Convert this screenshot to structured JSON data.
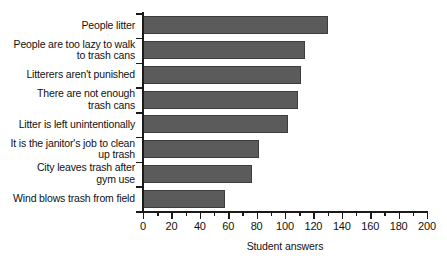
{
  "chart_data": {
    "type": "bar",
    "orientation": "horizontal",
    "title": "",
    "xlabel": "Student answers",
    "ylabel": "",
    "xlim": [
      0,
      200
    ],
    "xticks": [
      0,
      20,
      40,
      60,
      80,
      100,
      120,
      140,
      160,
      180,
      200
    ],
    "xtick_labels": [
      "0",
      "20",
      "40",
      "60",
      "80",
      "100",
      "120",
      "140",
      "160",
      "180",
      "200"
    ],
    "minor_tick_step": 10,
    "grid": false,
    "legend": null,
    "bar_color": "#5b5b5b",
    "bar_edge_color": "#3d3d3d",
    "axis_color": "#1a1a1a",
    "categories": [
      "People litter",
      "People are too lazy to walk\nto trash cans",
      "Litterers aren't punished",
      "There are not enough\ntrash cans",
      "Litter is left unintentionally",
      "It is the janitor's job to clean\nup trash",
      "City leaves trash after\ngym use",
      "Wind blows trash from field"
    ],
    "values": [
      130,
      114,
      111,
      109,
      102,
      82,
      77,
      58
    ]
  }
}
